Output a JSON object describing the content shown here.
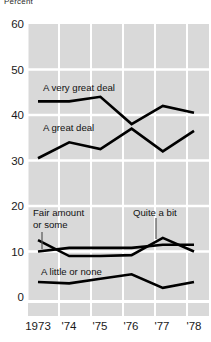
{
  "figure": {
    "cropped_top_label": "Percent",
    "background": "#ffffff",
    "plot_band_color": "#d9d9d9",
    "gridline_color": "#ffffff",
    "line_color": "#000000"
  },
  "axes": {
    "y_ticks": [
      "60",
      "50",
      "40",
      "30",
      "20",
      "10",
      "0"
    ],
    "x_ticks": [
      "1973",
      "'74",
      "'75",
      "'76",
      "'77",
      "'78"
    ]
  },
  "annotations": [
    {
      "name": "a-very-great-deal",
      "text": "A very great deal"
    },
    {
      "name": "a-great-deal",
      "text": "A great deal"
    },
    {
      "name": "fair-amount-or-some-line1",
      "text": "Fair amount"
    },
    {
      "name": "fair-amount-or-some-line2",
      "text": "or some"
    },
    {
      "name": "quite-a-bit",
      "text": "Quite a bit"
    },
    {
      "name": "a-little-or-none",
      "text": "A little or none"
    }
  ],
  "chart_data": {
    "type": "line",
    "title": "",
    "subtitle": "",
    "xlabel": "",
    "ylabel": "Percent",
    "x": [
      "1973",
      "'74",
      "'75",
      "'76",
      "'77",
      "'78"
    ],
    "x_values": [
      1973,
      1974,
      1975,
      1976,
      1977,
      1978
    ],
    "ylim": [
      0,
      60
    ],
    "y_ticks": [
      0,
      10,
      20,
      30,
      40,
      50,
      60
    ],
    "grid": "both-white-gridlines-on-gray-bands",
    "legend": "inline-annotations",
    "series": [
      {
        "name": "A very great deal",
        "values": [
          43,
          43,
          44,
          38,
          42,
          40.5
        ]
      },
      {
        "name": "A great deal",
        "values": [
          30.5,
          34,
          32.5,
          37,
          32,
          36.5
        ]
      },
      {
        "name": "Fair amount or some",
        "values": [
          10,
          10.8,
          10.8,
          10.8,
          11.5,
          11.5
        ]
      },
      {
        "name": "Quite a bit",
        "values": [
          12.5,
          9,
          9,
          9.2,
          13,
          10
        ]
      },
      {
        "name": "A little or none",
        "values": [
          3.3,
          3,
          4,
          5,
          2,
          3.3
        ]
      }
    ]
  }
}
